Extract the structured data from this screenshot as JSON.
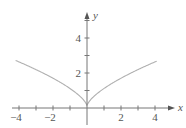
{
  "chart_data": {
    "type": "line",
    "title": "",
    "function": "y = x^(2/3)",
    "xlabel": "x",
    "ylabel": "y",
    "xlim": [
      -4.2,
      4.9
    ],
    "ylim": [
      -0.9,
      5.5
    ],
    "grid": false,
    "legend": null,
    "x_ticks": [
      -4,
      -3,
      -2,
      -1,
      0,
      1,
      2,
      3,
      4
    ],
    "x_tick_labels": [
      {
        "value": -4,
        "label": "−4"
      },
      {
        "value": -2,
        "label": "−2"
      },
      {
        "value": 2,
        "label": "2"
      },
      {
        "value": 4,
        "label": "4"
      }
    ],
    "y_ticks": [
      1,
      2,
      3,
      4,
      5
    ],
    "y_tick_labels": [
      {
        "value": 2,
        "label": "2"
      },
      {
        "value": 4,
        "label": "4"
      }
    ],
    "series": [
      {
        "name": "y = x^(2/3)",
        "color": "#b0b0b0",
        "x": [
          -4.2,
          -4,
          -3,
          -2,
          -1,
          -0.5,
          -0.1,
          0,
          0.1,
          0.5,
          1,
          2,
          3,
          4,
          4.1
        ],
        "y": [
          2.6,
          2.52,
          2.08,
          1.59,
          1.0,
          0.63,
          0.22,
          0,
          0.22,
          0.63,
          1.0,
          1.59,
          2.08,
          2.52,
          2.56
        ]
      }
    ]
  },
  "axes": {
    "x_label": "x",
    "y_label": "y",
    "axis_color": "#777777",
    "curve_color": "#b0b0b0"
  }
}
